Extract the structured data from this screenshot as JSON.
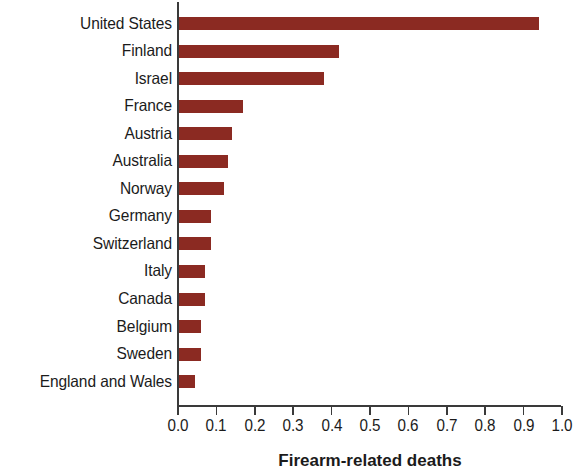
{
  "chart_data": {
    "type": "bar",
    "orientation": "horizontal",
    "title": "",
    "xlabel": "Firearm-related deaths",
    "ylabel": "",
    "xlim": [
      0.0,
      1.0
    ],
    "grid": false,
    "legend": null,
    "bar_color": "#8b2a22",
    "axis_color": "#3a3a3a",
    "xticks": [
      "0.0",
      "0.1",
      "0.2",
      "0.3",
      "0.4",
      "0.5",
      "0.6",
      "0.7",
      "0.8",
      "0.9",
      "1.0"
    ],
    "categories": [
      "United States",
      "Finland",
      "Israel",
      "France",
      "Austria",
      "Australia",
      "Norway",
      "Germany",
      "Switzerland",
      "Italy",
      "Canada",
      "Belgium",
      "Sweden",
      "England and Wales"
    ],
    "values": [
      0.94,
      0.42,
      0.38,
      0.17,
      0.14,
      0.13,
      0.12,
      0.085,
      0.085,
      0.07,
      0.07,
      0.06,
      0.06,
      0.045
    ]
  }
}
